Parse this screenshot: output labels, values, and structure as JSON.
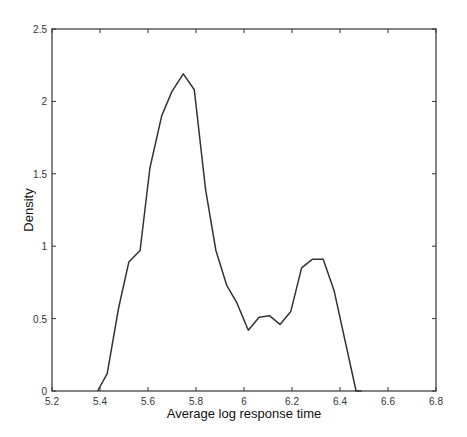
{
  "chart_data": {
    "type": "line",
    "title": "",
    "xlabel": "Average log response time",
    "ylabel": "Density",
    "xlim": [
      5.2,
      6.8
    ],
    "ylim": [
      0,
      2.5
    ],
    "xticks": [
      "5.2",
      "5.4",
      "5.6",
      "5.8",
      "6",
      "6.2",
      "6.4",
      "6.6",
      "6.8"
    ],
    "yticks": [
      "0",
      "0.5",
      "1",
      "1.5",
      "2",
      "2.5"
    ],
    "grid": false,
    "legend": null,
    "line_color": "#333333",
    "series": [
      {
        "name": "density",
        "x": [
          5.39,
          5.43,
          5.477,
          5.52,
          5.567,
          5.608,
          5.657,
          5.7,
          5.747,
          5.793,
          5.84,
          5.883,
          5.928,
          5.97,
          6.018,
          6.063,
          6.106,
          6.15,
          6.195,
          6.24,
          6.286,
          6.33,
          6.376,
          6.467,
          6.49
        ],
        "y": [
          0.0,
          0.12,
          0.57,
          0.89,
          0.97,
          1.54,
          1.9,
          2.07,
          2.19,
          2.08,
          1.39,
          0.97,
          0.73,
          0.61,
          0.42,
          0.51,
          0.52,
          0.46,
          0.55,
          0.85,
          0.91,
          0.91,
          0.69,
          0.0,
          0.0
        ]
      }
    ]
  }
}
